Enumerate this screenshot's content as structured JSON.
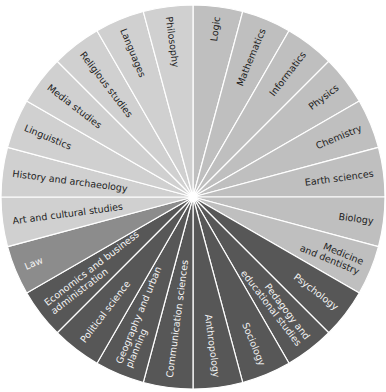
{
  "chart_data": {
    "type": "pie",
    "title": "",
    "center": [
      193,
      197
    ],
    "radius": 192,
    "start_angle_deg": 0,
    "direction": "clockwise",
    "slice_angle_deg": 15,
    "groups": {
      "sciences": {
        "color": "#bfbfbf",
        "text_color": "#1e1e1e"
      },
      "humanities": {
        "color": "#d0d0d0",
        "text_color": "#1e1e1e"
      },
      "law": {
        "color": "#8c8c8c",
        "text_color": "#f2f2f2"
      },
      "social": {
        "color": "#575757",
        "text_color": "#f2f2f2"
      }
    },
    "categories": [
      {
        "label": "Logic",
        "group": "sciences"
      },
      {
        "label": "Mathematics",
        "group": "sciences"
      },
      {
        "label": "Informatics",
        "group": "sciences"
      },
      {
        "label": "Physics",
        "group": "sciences"
      },
      {
        "label": "Chemistry",
        "group": "sciences"
      },
      {
        "label": "Earth sciences",
        "group": "sciences"
      },
      {
        "label": "Biology",
        "group": "sciences"
      },
      {
        "label": "Medicine|and dentistry",
        "group": "sciences"
      },
      {
        "label": "Psychology",
        "group": "social"
      },
      {
        "label": "Pedagogy and|educational studies",
        "group": "social"
      },
      {
        "label": "Sociology",
        "group": "social"
      },
      {
        "label": "Anthropology",
        "group": "social"
      },
      {
        "label": "Communication sciences",
        "group": "social"
      },
      {
        "label": "Geography and urban|planning",
        "group": "social"
      },
      {
        "label": "Political science",
        "group": "social"
      },
      {
        "label": "Economics and business|administration",
        "group": "social"
      },
      {
        "label": "Law",
        "group": "law"
      },
      {
        "label": "Art and cultural studies",
        "group": "humanities"
      },
      {
        "label": "History and archaeology",
        "group": "humanities"
      },
      {
        "label": "Linguistics",
        "group": "humanities"
      },
      {
        "label": "Media studies",
        "group": "humanities"
      },
      {
        "label": "Religious studies",
        "group": "humanities"
      },
      {
        "label": "Languages",
        "group": "humanities"
      },
      {
        "label": "Philosophy",
        "group": "humanities"
      }
    ],
    "values": [
      1,
      1,
      1,
      1,
      1,
      1,
      1,
      1,
      1,
      1,
      1,
      1,
      1,
      1,
      1,
      1,
      1,
      1,
      1,
      1,
      1,
      1,
      1,
      1
    ],
    "separator_color": "#ffffff",
    "hub_color": "#ffffff"
  }
}
